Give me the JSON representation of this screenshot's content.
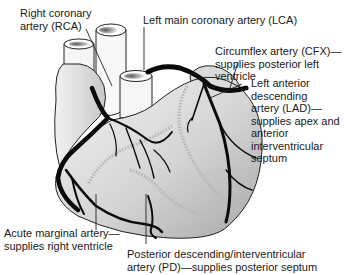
{
  "diagram": {
    "labels": {
      "rca": "Right coronary\nartery (RCA)",
      "lca": "Left main coronary artery (LCA)",
      "cfx": "Circumflex artery (CFX)—\nsupplies posterior left ventricle",
      "lad": "Left anterior\ndescending\nartery (LAD)—\nsupplies apex and\nanterior\ninterventricular\nseptum",
      "acute_marginal": "Acute marginal artery—\nsupplies right ventricle",
      "pd": "Posterior descending/interventricular\nartery (PD)—supplies posterior septum"
    },
    "colors": {
      "artery": "#0a0a0a",
      "heart_fill_light": "#f2f2f2",
      "heart_fill_dark": "#a9a9a9",
      "posterior_vessel": "#b5b5b5",
      "leader_line": "#222222"
    }
  }
}
